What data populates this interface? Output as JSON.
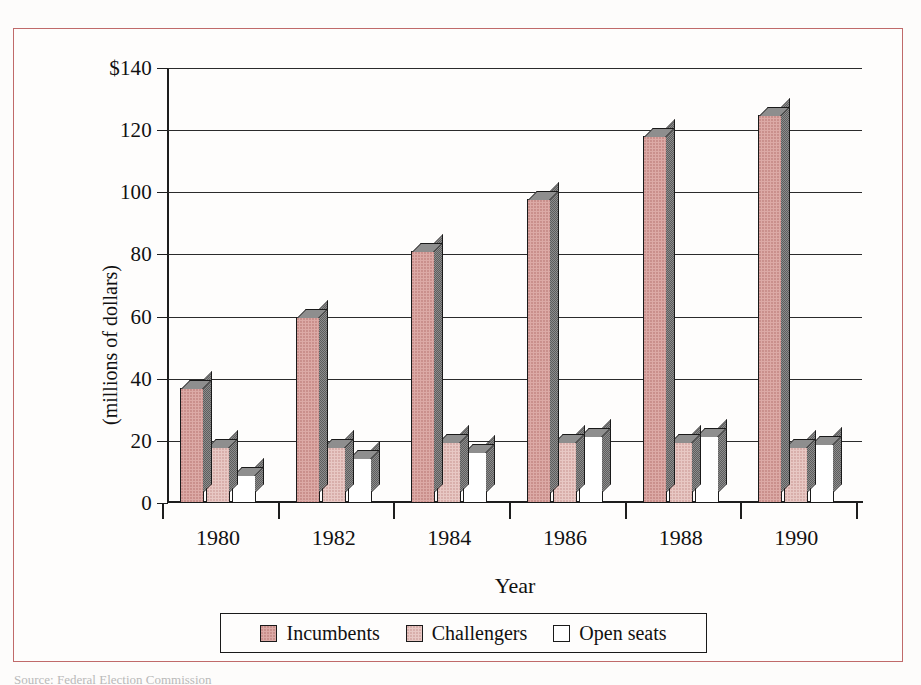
{
  "figure": {
    "border_color": "#c06a6a",
    "caption_partial": "Source: Federal Election Commission"
  },
  "axes": {
    "y_title": "(millions of dollars)",
    "x_title": "Year",
    "y_ticks": [
      "0",
      "20",
      "40",
      "60",
      "80",
      "100",
      "120",
      "$140"
    ],
    "y_min": 0,
    "y_max": 140
  },
  "legend": {
    "items": [
      {
        "label": "Incumbents",
        "color": "#dcaaa6",
        "swatch": "swatch-incumbents"
      },
      {
        "label": "Challengers",
        "color": "#e8c8c4",
        "swatch": "swatch-challengers"
      },
      {
        "label": "Open seats",
        "color": "#ffffff",
        "swatch": "swatch-open-seats"
      }
    ]
  },
  "chart_data": {
    "type": "bar",
    "title": "",
    "xlabel": "Year",
    "ylabel": "(millions of dollars)",
    "ylim": [
      0,
      140
    ],
    "ytick_values": [
      0,
      20,
      40,
      60,
      80,
      100,
      120,
      140
    ],
    "ytick_labels": [
      "0",
      "20",
      "40",
      "60",
      "80",
      "100",
      "120",
      "$140"
    ],
    "grid": true,
    "legend_position": "bottom",
    "categories": [
      "1980",
      "1982",
      "1984",
      "1986",
      "1988",
      "1990"
    ],
    "series": [
      {
        "name": "Incumbents",
        "color": "#dcaaa6",
        "values": [
          37,
          60,
          81,
          98,
          118,
          125
        ]
      },
      {
        "name": "Challengers",
        "color": "#e8c8c4",
        "values": [
          18,
          18,
          19.5,
          19.5,
          19.5,
          18
        ]
      },
      {
        "name": "Open seats",
        "color": "#ffffff",
        "values": [
          9,
          14.5,
          16.5,
          21.5,
          21.5,
          19
        ]
      }
    ]
  }
}
